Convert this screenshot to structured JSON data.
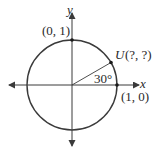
{
  "diagram": {
    "colors": {
      "stroke": "#3a3a3a",
      "text": "#2a2a2a",
      "background": "#ffffff"
    },
    "axes": {
      "x_label": "x",
      "y_label": "y"
    },
    "points": [
      {
        "id": "top",
        "label": "(0, 1)"
      },
      {
        "id": "right",
        "label": "(1, 0)"
      },
      {
        "id": "u",
        "name": "U",
        "coords": "(?, ?)"
      }
    ],
    "angle": {
      "label": "30°",
      "degrees": 30
    }
  }
}
